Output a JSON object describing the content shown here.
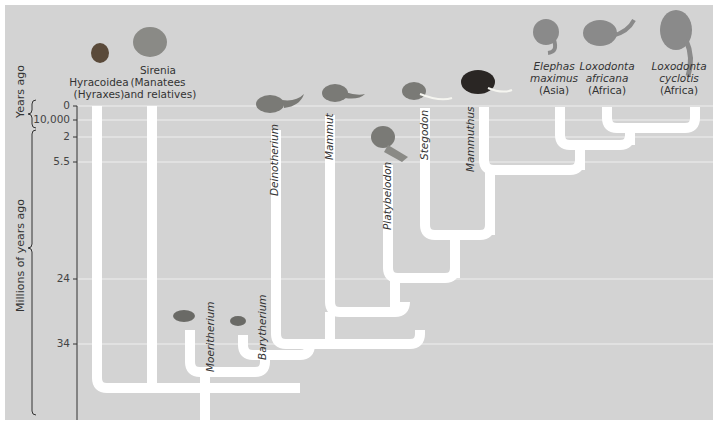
{
  "figure": {
    "type": "phylogenetic-tree",
    "colors": {
      "panel": "#d3d3d3",
      "branch": "#ffffff",
      "gridline": "#eeeeee",
      "text": "#333333",
      "axis": "#333333"
    }
  },
  "axis": {
    "title_recent": "Years ago",
    "title_deep": "Millions of years ago",
    "ticks": [
      {
        "label": "0",
        "y": 106
      },
      {
        "label": "10,000",
        "y": 120
      },
      {
        "label": "2",
        "y": 137
      },
      {
        "label": "5.5",
        "y": 162
      },
      {
        "label": "24",
        "y": 279
      },
      {
        "label": "34",
        "y": 344
      }
    ]
  },
  "taxa": [
    {
      "id": "hyracoidea",
      "line1": "Hyracoidea",
      "line2": "(Hyraxes)",
      "line3": "",
      "italic": false
    },
    {
      "id": "sirenia",
      "line1": "Sirenia",
      "line2": "(Manatees",
      "line3": "and relatives)",
      "italic": false
    },
    {
      "id": "moeritherium",
      "line1": "Moeritherium",
      "italic": true
    },
    {
      "id": "barytherium",
      "line1": "Barytherium",
      "italic": true
    },
    {
      "id": "deinotherium",
      "line1": "Deinotherium",
      "italic": true
    },
    {
      "id": "mammut",
      "line1": "Mammut",
      "italic": true
    },
    {
      "id": "platybelodon",
      "line1": "Platybelodon",
      "italic": true
    },
    {
      "id": "stegodon",
      "line1": "Stegodon",
      "italic": true
    },
    {
      "id": "mammuthus",
      "line1": "Mammuthus",
      "italic": true
    },
    {
      "id": "elephas",
      "line1": "Elephas",
      "line2": "maximus",
      "line3": "(Asia)"
    },
    {
      "id": "loxodonta-africana",
      "line1": "Loxodonta",
      "line2": "africana",
      "line3": "(Africa)"
    },
    {
      "id": "loxodonta-cyclotis",
      "line1": "Loxodonta",
      "line2": "cyclotis",
      "line3": "(Africa)"
    }
  ]
}
